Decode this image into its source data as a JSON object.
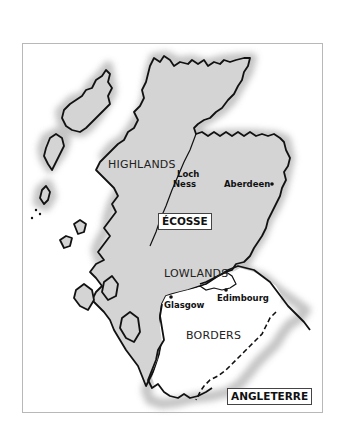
{
  "map": {
    "title": "Scotland regions map",
    "colors": {
      "land_scotland": "#d4d4d4",
      "land_borders": "#ffffff",
      "coast_halo": "#bdbdbd",
      "coastline": "#111111",
      "frame": "#b8b8b8",
      "background": "#ffffff"
    },
    "labels": {
      "country": "ÉCOSSE",
      "neighbor": "ANGLETERRE",
      "regions": {
        "highlands": "HIGHLANDS",
        "lowlands": "LOWLANDS",
        "borders": "BORDERS"
      },
      "loch": [
        "Loch",
        "Ness"
      ],
      "cities": {
        "aberdeen": "Aberdeen",
        "glasgow": "Glasgow",
        "edinburgh": "Edimbourg"
      }
    }
  }
}
